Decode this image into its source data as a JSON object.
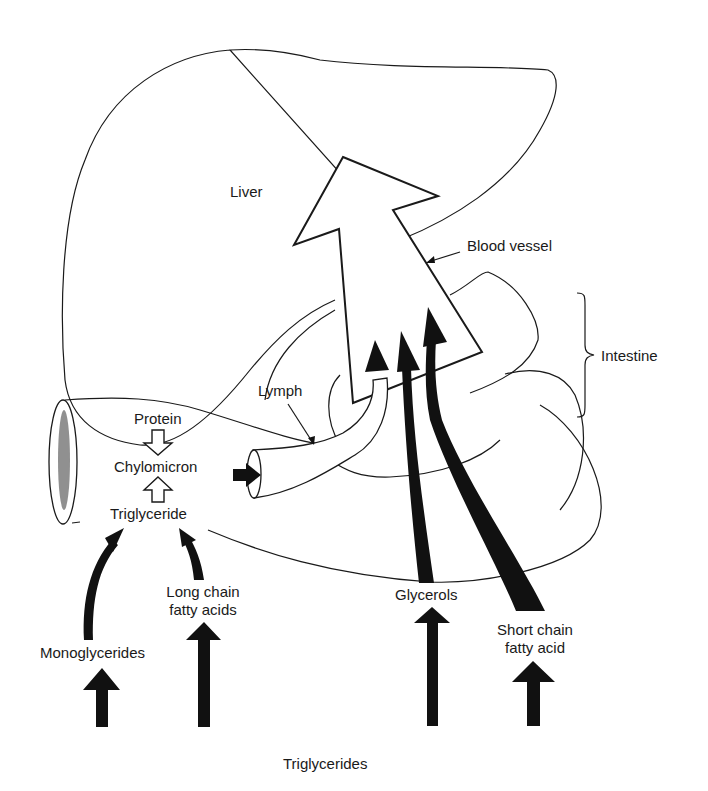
{
  "diagram": {
    "type": "physiology-flow-diagram",
    "colors": {
      "ink": "#1a1a1a",
      "fill": "#111111",
      "background": "#ffffff"
    },
    "organs": {
      "liver": "Liver",
      "intestine": "Intestine",
      "blood_vessel": "Blood vessel",
      "lymph": "Lymph"
    },
    "intestine_inner": {
      "protein": "Protein",
      "chylomicron": "Chylomicron",
      "triglyceride": "Triglyceride"
    },
    "inputs": {
      "monoglycerides": "Monoglycerides",
      "long_chain_line1": "Long chain",
      "long_chain_line2": "fatty acids",
      "glycerols": "Glycerols",
      "short_chain_line1": "Short chain",
      "short_chain_line2": "fatty acid"
    },
    "source": "Triglycerides",
    "flows": [
      {
        "from": "Triglycerides",
        "to": "Monoglycerides",
        "arrow": "solid-up"
      },
      {
        "from": "Triglycerides",
        "to": "Long chain fatty acids",
        "arrow": "solid-up"
      },
      {
        "from": "Triglycerides",
        "to": "Glycerols",
        "arrow": "solid-up"
      },
      {
        "from": "Triglycerides",
        "to": "Short chain fatty acid",
        "arrow": "solid-up"
      },
      {
        "from": "Monoglycerides",
        "to": "Triglyceride",
        "arrow": "curved-solid"
      },
      {
        "from": "Long chain fatty acids",
        "to": "Triglyceride",
        "arrow": "curved-solid"
      },
      {
        "from": "Triglyceride",
        "to": "Chylomicron",
        "arrow": "hollow-up"
      },
      {
        "from": "Protein",
        "to": "Chylomicron",
        "arrow": "hollow-down"
      },
      {
        "from": "Chylomicron",
        "to": "Lymph",
        "arrow": "solid-right"
      },
      {
        "from": "Lymph",
        "to": "Blood vessel",
        "arrow": "curved-solid"
      },
      {
        "from": "Glycerols",
        "to": "Blood vessel",
        "arrow": "curved-solid"
      },
      {
        "from": "Short chain fatty acid",
        "to": "Blood vessel",
        "arrow": "curved-solid"
      },
      {
        "from": "Blood vessel",
        "to": "Liver",
        "arrow": "large-hollow"
      }
    ]
  }
}
